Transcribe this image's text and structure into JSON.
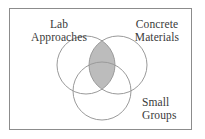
{
  "figure": {
    "kind": "venn-diagram",
    "background_color": "#ffffff",
    "frame": {
      "stroke_color": "#8c8c8c",
      "stroke_width": 1,
      "x": 9,
      "y": 8,
      "width": 183,
      "height": 122
    },
    "circle_stroke_color": "#9a9a9a",
    "circle_stroke_width": 1,
    "shade_color": "#bcbcbc",
    "text_color": "#3a3a3a"
  },
  "chart_data": {
    "type": "venn",
    "title": "",
    "sets": [
      {
        "id": "lab-approaches",
        "label_lines": [
          "Lab",
          "Approaches"
        ],
        "label": "Lab Approaches",
        "cx": 86,
        "cy": 65,
        "r": 29,
        "filled": false
      },
      {
        "id": "concrete-materials",
        "label_lines": [
          "Concrete",
          "Materials"
        ],
        "label": "Concrete Materials",
        "cx": 118,
        "cy": 65,
        "r": 29,
        "filled": false
      },
      {
        "id": "small-groups",
        "label_lines": [
          "Small",
          "Groups"
        ],
        "label": "Small Groups",
        "cx": 102,
        "cy": 91,
        "r": 29,
        "filled": false
      }
    ],
    "shaded_regions": [
      {
        "id": "lab-concrete-overlap",
        "sets": [
          "lab-approaches",
          "concrete-materials"
        ],
        "color": "#bcbcbc",
        "description": "intersection of Lab Approaches and Concrete Materials"
      }
    ],
    "legend": null,
    "grid": false
  },
  "labels": {
    "lab": {
      "line1": "Lab",
      "line2": "Approaches"
    },
    "concrete": {
      "line1": "Concrete",
      "line2": "Materials"
    },
    "small": {
      "line1": "Small",
      "line2": "Groups"
    }
  }
}
